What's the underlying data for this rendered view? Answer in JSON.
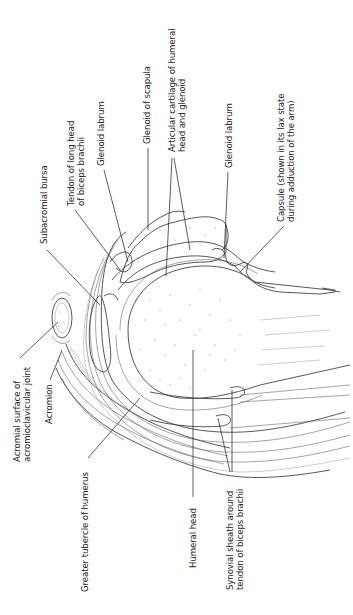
{
  "figure": {
    "labels": [
      {
        "id": "acromial-surface",
        "text_lines": [
          "Acromial surface of",
          "acromioclavicular joint"
        ]
      },
      {
        "id": "acromion",
        "text_lines": [
          "Acromion"
        ]
      },
      {
        "id": "greater-tubercle",
        "text_lines": [
          "Greater tubercle of humerus"
        ]
      },
      {
        "id": "subacromial-bursa",
        "text_lines": [
          "Subacromial bursa"
        ]
      },
      {
        "id": "tendon-long-head",
        "text_lines": [
          "Tendon of long head",
          "of biceps brachii"
        ]
      },
      {
        "id": "glenoid-labrum-upper",
        "text_lines": [
          "Glenoid labrum"
        ]
      },
      {
        "id": "glenoid-scapula",
        "text_lines": [
          "Glenoid of scapula"
        ]
      },
      {
        "id": "articular-cartilage",
        "text_lines": [
          "Articular cartilage of humeral",
          "head and glenoid"
        ]
      },
      {
        "id": "glenoid-labrum-lower",
        "text_lines": [
          "Glenoid labrum"
        ]
      },
      {
        "id": "capsule",
        "text_lines": [
          "Capsule (shown in its lax state",
          "during adduction of the arm)"
        ]
      },
      {
        "id": "humeral-head",
        "text_lines": [
          "Humeral head"
        ]
      },
      {
        "id": "synovial-sheath",
        "text_lines": [
          "Synovial sheath around",
          "tendon of biceps brachii"
        ]
      }
    ]
  }
}
